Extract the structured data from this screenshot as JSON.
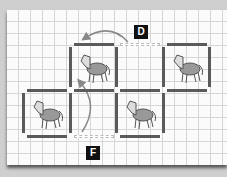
{
  "labels": {
    "d": "D",
    "f": "F"
  },
  "figures": [
    "horse",
    "horse",
    "horse",
    "horse"
  ],
  "colors": {
    "stick": "#5a5a5a",
    "arrow": "#888888",
    "label_bg": "#111111"
  }
}
